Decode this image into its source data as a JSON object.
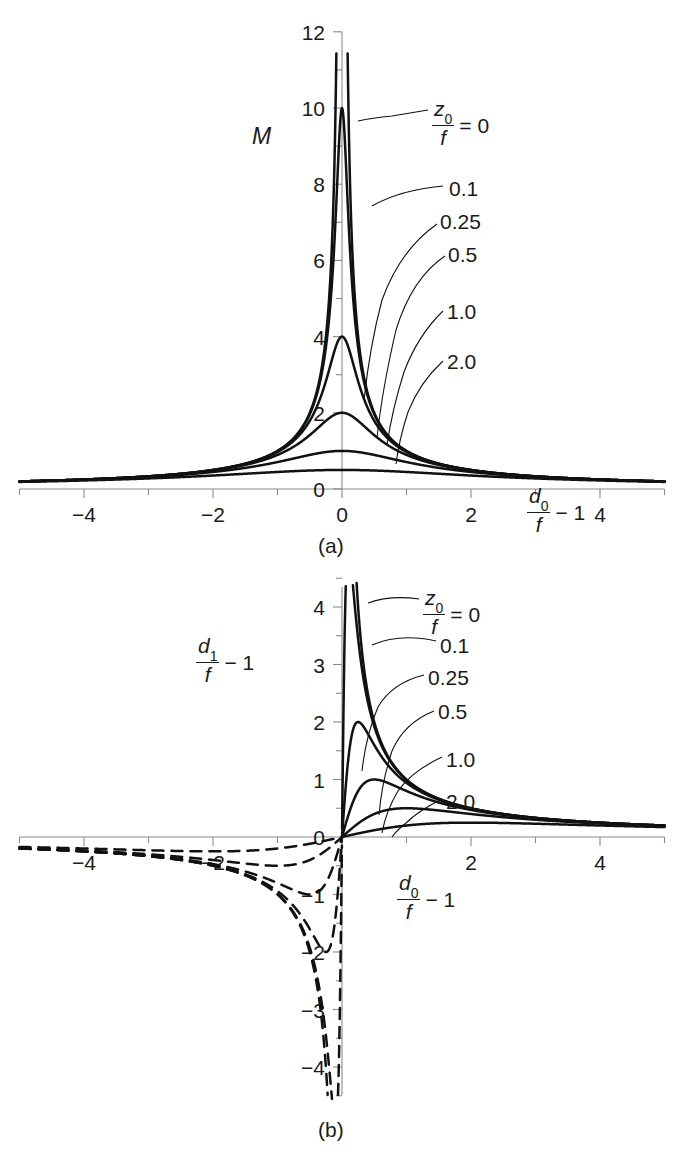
{
  "figure": {
    "panels": [
      {
        "id": "a",
        "caption": "(a)",
        "y_axis": {
          "label_main": "M",
          "ticks": [
            "0",
            "2",
            "4",
            "6",
            "8",
            "10",
            "12"
          ],
          "tick_values": [
            0,
            2,
            4,
            6,
            8,
            10,
            12
          ],
          "range": [
            0,
            12
          ]
        },
        "x_axis": {
          "label_numerator": "d",
          "label_numerator_sub": "0",
          "label_denominator": "f",
          "label_suffix": "− 1",
          "ticks": [
            "−4",
            "−2",
            "0",
            "2",
            "4"
          ],
          "tick_values": [
            -4,
            -2,
            0,
            2,
            4
          ],
          "range": [
            -5,
            5
          ]
        },
        "curve_labels": [
          {
            "text": "= 0",
            "param": "0",
            "prefix_numerator": "z",
            "prefix_sub": "0",
            "prefix_denominator": "f"
          },
          {
            "text": "0.1",
            "param": "0.1"
          },
          {
            "text": "0.25",
            "param": "0.25"
          },
          {
            "text": "0.5",
            "param": "0.5"
          },
          {
            "text": "1.0",
            "param": "1.0"
          },
          {
            "text": "2.0",
            "param": "2.0"
          }
        ]
      },
      {
        "id": "b",
        "caption": "(b)",
        "y_axis": {
          "label_numerator": "d",
          "label_numerator_sub": "1",
          "label_denominator": "f",
          "label_suffix": "− 1",
          "ticks": [
            "−4",
            "−3",
            "−2",
            "−1",
            "0",
            "1",
            "2",
            "3",
            "4"
          ],
          "tick_values": [
            -4,
            -3,
            -2,
            -1,
            0,
            1,
            2,
            3,
            4
          ],
          "range": [
            -4.4,
            4.4
          ]
        },
        "x_axis": {
          "label_numerator": "d",
          "label_numerator_sub": "0",
          "label_denominator": "f",
          "label_suffix": "− 1",
          "ticks": [
            "−4",
            "−2",
            "2",
            "4"
          ],
          "tick_values": [
            -4,
            -2,
            2,
            4
          ],
          "range": [
            -5,
            5
          ]
        },
        "curve_labels": [
          {
            "text": "= 0",
            "param": "0",
            "prefix_numerator": "z",
            "prefix_sub": "0",
            "prefix_denominator": "f"
          },
          {
            "text": "0.1",
            "param": "0.1"
          },
          {
            "text": "0.25",
            "param": "0.25"
          },
          {
            "text": "0.5",
            "param": "0.5"
          },
          {
            "text": "1.0",
            "param": "1.0"
          },
          {
            "text": "2.0",
            "param": "2.0"
          }
        ]
      }
    ]
  },
  "chart_data": [
    {
      "type": "line",
      "panel": "a",
      "title": "",
      "xlabel": "d0/f - 1",
      "ylabel": "M",
      "xlim": [
        -5,
        5
      ],
      "ylim": [
        0,
        12
      ],
      "grid": false,
      "legend": "inline-leader-labels",
      "formula": "M = 1 / sqrt(x^2 + z^2)  where x = d0/f - 1 and z = z0/f",
      "series": [
        {
          "name": "z0/f = 0",
          "z": 0.0,
          "peak": 12.0,
          "peak_x": 0.0,
          "note": "diverges at x=0, clipped at top of frame"
        },
        {
          "name": "z0/f = 0.1",
          "z": 0.1,
          "peak": 10.0,
          "peak_x": 0.0
        },
        {
          "name": "z0/f = 0.25",
          "z": 0.25,
          "peak": 4.0,
          "peak_x": 0.0
        },
        {
          "name": "z0/f = 0.5",
          "z": 0.5,
          "peak": 2.0,
          "peak_x": 0.0
        },
        {
          "name": "z0/f = 1.0",
          "z": 1.0,
          "peak": 1.0,
          "peak_x": 0.0
        },
        {
          "name": "z0/f = 2.0",
          "z": 2.0,
          "peak": 0.5,
          "peak_x": 0.0
        }
      ],
      "sampled_points": {
        "x": [
          -5,
          -4,
          -3,
          -2,
          -1,
          -0.5,
          -0.25,
          0,
          0.25,
          0.5,
          1,
          2,
          3,
          4,
          5
        ],
        "z_0.25": [
          0.2,
          0.249,
          0.332,
          0.496,
          0.97,
          1.789,
          2.828,
          4.0,
          2.828,
          1.789,
          0.97,
          0.496,
          0.332,
          0.249,
          0.2
        ],
        "z_0.5": [
          0.199,
          0.248,
          0.329,
          0.485,
          0.894,
          1.414,
          1.789,
          2.0,
          1.789,
          1.414,
          0.894,
          0.485,
          0.329,
          0.248,
          0.199
        ],
        "z_1.0": [
          0.196,
          0.243,
          0.316,
          0.447,
          0.707,
          0.894,
          0.97,
          1.0,
          0.97,
          0.894,
          0.707,
          0.447,
          0.316,
          0.243,
          0.196
        ],
        "z_2.0": [
          0.186,
          0.224,
          0.277,
          0.354,
          0.447,
          0.485,
          0.496,
          0.5,
          0.496,
          0.485,
          0.447,
          0.354,
          0.277,
          0.224,
          0.186
        ]
      }
    },
    {
      "type": "line",
      "panel": "b",
      "title": "",
      "xlabel": "d0/f - 1",
      "ylabel": "d1/f - 1",
      "xlim": [
        -5,
        5
      ],
      "ylim": [
        -4.4,
        4.4
      ],
      "grid": false,
      "legend": "inline-leader-labels",
      "formula": "d1/f - 1 = x / (x^2 + z^2)  where x = d0/f - 1 and z = z0/f",
      "line_styles": {
        "positive_x": "solid",
        "negative_x": "dashed"
      },
      "series": [
        {
          "name": "z0/f = 0",
          "z": 0.0,
          "peak": 4.4,
          "note": "diverges at x=0+, clipped"
        },
        {
          "name": "z0/f = 0.1",
          "z": 0.1,
          "peak": 5.0,
          "peak_x": 0.1
        },
        {
          "name": "z0/f = 0.25",
          "z": 0.25,
          "peak": 2.0,
          "peak_x": 0.25
        },
        {
          "name": "z0/f = 0.5",
          "z": 0.5,
          "peak": 1.0,
          "peak_x": 0.5
        },
        {
          "name": "z0/f = 1.0",
          "z": 1.0,
          "peak": 0.5,
          "peak_x": 1.0
        },
        {
          "name": "z0/f = 2.0",
          "z": 2.0,
          "peak": 0.25,
          "peak_x": 2.0
        }
      ],
      "sampled_points": {
        "x": [
          -5,
          -4,
          -3,
          -2,
          -1,
          -0.5,
          -0.25,
          0,
          0.25,
          0.5,
          1,
          2,
          3,
          4,
          5
        ],
        "z_0.25": [
          -0.199,
          -0.249,
          -0.332,
          -0.992,
          -0.941,
          -1.6,
          -2.0,
          0,
          2.0,
          1.6,
          0.941,
          0.496,
          0.332,
          0.249,
          0.199
        ],
        "z_0.5": [
          -0.198,
          -0.248,
          -0.329,
          -0.485,
          -0.8,
          -1.0,
          -0.8,
          0,
          0.8,
          1.0,
          0.8,
          0.471,
          0.324,
          0.246,
          0.198
        ],
        "z_1.0": [
          -0.192,
          -0.235,
          -0.3,
          -0.4,
          -0.5,
          -0.4,
          -0.235,
          0,
          0.235,
          0.4,
          0.5,
          0.4,
          0.3,
          0.235,
          0.192
        ],
        "z_2.0": [
          -0.172,
          -0.2,
          -0.231,
          -0.25,
          -0.2,
          -0.118,
          -0.062,
          0,
          0.062,
          0.118,
          0.2,
          0.25,
          0.231,
          0.2,
          0.172
        ]
      }
    }
  ]
}
